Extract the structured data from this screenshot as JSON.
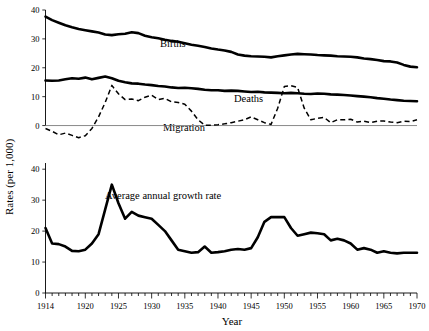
{
  "figure": {
    "ylabel": "Rates (per 1,000)",
    "xlabel": "Year"
  },
  "labels": {
    "births": "Births",
    "deaths": "Deaths",
    "migration": "Migration",
    "growth": "Average annual growth rate"
  },
  "axes": {
    "x_ticks_major": [
      1914,
      1920,
      1925,
      1930,
      1935,
      1940,
      1945,
      1950,
      1955,
      1960,
      1965,
      1970
    ],
    "x_tick_labels": [
      "1914",
      "1920",
      "1925",
      "1930",
      "1935",
      "1940",
      "1945",
      "1950",
      "1955",
      "1960",
      "1965",
      "1970"
    ],
    "x_min": 1913,
    "x_max": 1970,
    "top_y_ticks": [
      0,
      10,
      20,
      30,
      40
    ],
    "top_y_tick_labels": [
      "0",
      "10",
      "20",
      "30",
      "40"
    ],
    "top_y_min": -5,
    "top_y_max": 40,
    "bottom_y_ticks": [
      0,
      10,
      20,
      30,
      40
    ],
    "bottom_y_tick_labels": [
      "0",
      "10",
      "20",
      "30",
      "40"
    ],
    "bottom_y_min": 0,
    "bottom_y_max": 42
  },
  "colors": {
    "line": "#000000",
    "background": "#ffffff",
    "zero_rule": "#6b6b6b"
  },
  "chart_data": {
    "type": "line",
    "title": "",
    "subtitle": "",
    "xlabel": "Year",
    "ylabel": "Rates (per 1,000)",
    "grid": false,
    "legend": "inline-annotations",
    "panels": [
      {
        "name": "top-panel",
        "ylim": [
          -5,
          40
        ],
        "yticks": [
          0,
          10,
          20,
          30,
          40
        ],
        "xlim": [
          1913,
          1970
        ],
        "series": [
          {
            "name": "Births",
            "style": "solid-thick",
            "x": [
              1914,
              1915,
              1916,
              1917,
              1918,
              1919,
              1920,
              1921,
              1922,
              1923,
              1924,
              1925,
              1926,
              1927,
              1928,
              1929,
              1930,
              1931,
              1932,
              1933,
              1934,
              1935,
              1936,
              1937,
              1938,
              1939,
              1940,
              1941,
              1942,
              1943,
              1944,
              1945,
              1946,
              1947,
              1948,
              1949,
              1950,
              1951,
              1952,
              1953,
              1954,
              1955,
              1956,
              1957,
              1958,
              1959,
              1960,
              1961,
              1962,
              1963,
              1964,
              1965,
              1966,
              1967,
              1968,
              1969,
              1970
            ],
            "values": [
              37.7,
              36.5,
              35.6,
              34.7,
              34.0,
              33.4,
              33.0,
              32.6,
              32.2,
              31.5,
              31.3,
              31.6,
              31.8,
              32.3,
              32.0,
              31.1,
              30.6,
              30.2,
              29.7,
              29.3,
              29.0,
              28.5,
              28.0,
              27.6,
              27.2,
              26.7,
              26.3,
              26.0,
              25.5,
              24.6,
              24.2,
              24.0,
              23.9,
              23.8,
              23.6,
              24.0,
              24.3,
              24.6,
              24.8,
              24.7,
              24.6,
              24.4,
              24.3,
              24.2,
              24.0,
              23.9,
              23.8,
              23.6,
              23.2,
              23.0,
              22.7,
              22.3,
              22.2,
              21.8,
              21.0,
              20.4,
              20.2
            ]
          },
          {
            "name": "Deaths",
            "style": "solid-thick",
            "x": [
              1914,
              1915,
              1916,
              1917,
              1918,
              1919,
              1920,
              1921,
              1922,
              1923,
              1924,
              1925,
              1926,
              1927,
              1928,
              1929,
              1930,
              1931,
              1932,
              1933,
              1934,
              1935,
              1936,
              1937,
              1938,
              1939,
              1940,
              1941,
              1942,
              1943,
              1944,
              1945,
              1946,
              1947,
              1948,
              1949,
              1950,
              1951,
              1952,
              1953,
              1954,
              1955,
              1956,
              1957,
              1958,
              1959,
              1960,
              1961,
              1962,
              1963,
              1964,
              1965,
              1966,
              1967,
              1968,
              1969,
              1970
            ],
            "values": [
              15.6,
              15.5,
              15.6,
              16.0,
              16.4,
              16.2,
              16.6,
              16.0,
              16.5,
              17.0,
              16.4,
              15.5,
              15.0,
              14.6,
              14.5,
              14.2,
              14.0,
              13.7,
              13.5,
              13.2,
              13.0,
              13.1,
              12.9,
              12.7,
              12.4,
              12.2,
              12.2,
              12.0,
              12.1,
              12.0,
              11.8,
              11.6,
              11.7,
              11.5,
              11.4,
              11.3,
              11.2,
              11.3,
              11.2,
              11.0,
              10.9,
              11.1,
              11.0,
              10.8,
              10.7,
              10.6,
              10.4,
              10.2,
              10.0,
              9.8,
              9.5,
              9.3,
              9.0,
              8.8,
              8.6,
              8.5,
              8.4
            ]
          },
          {
            "name": "Migration",
            "style": "dashed",
            "x": [
              1914,
              1915,
              1916,
              1917,
              1918,
              1919,
              1920,
              1921,
              1922,
              1923,
              1924,
              1925,
              1926,
              1927,
              1928,
              1929,
              1930,
              1931,
              1932,
              1933,
              1934,
              1935,
              1936,
              1937,
              1938,
              1939,
              1940,
              1941,
              1942,
              1943,
              1944,
              1945,
              1946,
              1947,
              1948,
              1949,
              1950,
              1951,
              1952,
              1953,
              1954,
              1955,
              1956,
              1957,
              1958,
              1959,
              1960,
              1961,
              1962,
              1963,
              1964,
              1965,
              1966,
              1967,
              1968,
              1969,
              1970
            ],
            "values": [
              -1.0,
              -2.0,
              -3.2,
              -2.6,
              -3.4,
              -4.2,
              -3.5,
              -1.0,
              3.0,
              8.0,
              13.9,
              11.0,
              9.0,
              9.2,
              8.6,
              9.8,
              10.5,
              9.0,
              9.4,
              8.2,
              8.0,
              7.4,
              5.0,
              2.0,
              0.1,
              0.1,
              0.3,
              0.6,
              1.0,
              1.5,
              2.0,
              3.0,
              2.0,
              1.0,
              0.4,
              6.0,
              13.5,
              13.8,
              13.2,
              6.0,
              2.0,
              2.5,
              2.8,
              1.0,
              2.0,
              2.0,
              2.2,
              1.2,
              1.5,
              1.0,
              1.5,
              1.6,
              1.2,
              1.0,
              1.5,
              1.4,
              2.0
            ]
          }
        ]
      },
      {
        "name": "bottom-panel",
        "ylim": [
          0,
          42
        ],
        "yticks": [
          0,
          10,
          20,
          30,
          40
        ],
        "xlim": [
          1913,
          1970
        ],
        "series": [
          {
            "name": "Average annual growth rate",
            "style": "solid-thick",
            "x": [
              1914,
              1915,
              1916,
              1917,
              1918,
              1919,
              1920,
              1921,
              1922,
              1923,
              1924,
              1925,
              1926,
              1927,
              1928,
              1929,
              1930,
              1931,
              1932,
              1933,
              1934,
              1935,
              1936,
              1937,
              1938,
              1939,
              1940,
              1941,
              1942,
              1943,
              1944,
              1945,
              1946,
              1947,
              1948,
              1949,
              1950,
              1951,
              1952,
              1953,
              1954,
              1955,
              1956,
              1957,
              1958,
              1959,
              1960,
              1961,
              1962,
              1963,
              1964,
              1965,
              1966,
              1967,
              1968,
              1969,
              1970
            ],
            "values": [
              21.0,
              16.0,
              15.8,
              15.0,
              13.6,
              13.5,
              14.0,
              16.0,
              19.0,
              27.0,
              35.0,
              29.0,
              24.0,
              26.2,
              25.0,
              24.5,
              24.0,
              22.0,
              20.0,
              17.0,
              14.0,
              13.5,
              13.0,
              13.2,
              15.0,
              13.0,
              13.2,
              13.5,
              14.0,
              14.2,
              14.0,
              14.5,
              18.0,
              23.0,
              24.5,
              24.5,
              24.5,
              21.0,
              18.5,
              19.0,
              19.5,
              19.3,
              19.0,
              17.0,
              17.5,
              17.0,
              16.0,
              14.0,
              14.5,
              14.0,
              13.0,
              13.5,
              13.0,
              12.8,
              13.0,
              13.0,
              13.0
            ]
          }
        ]
      }
    ]
  }
}
